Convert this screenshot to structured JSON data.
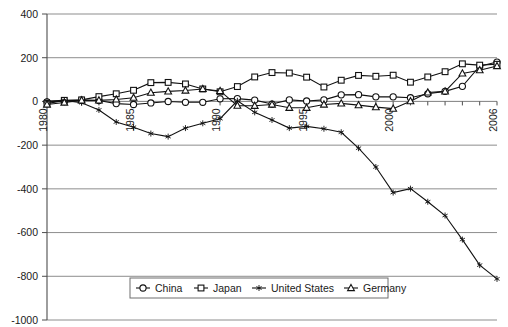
{
  "chart_data": {
    "type": "line",
    "title": "",
    "xlabel": "",
    "ylabel": "",
    "ylim": [
      -1000,
      400
    ],
    "xlim": [
      1980,
      2006
    ],
    "grid": true,
    "legend_position": "bottom",
    "ytick_labels": [
      "400",
      "200",
      "0",
      "-200",
      "-400",
      "-600",
      "-800",
      "-1000"
    ],
    "ytick_values": [
      400,
      200,
      0,
      -200,
      -400,
      -600,
      -800,
      -1000
    ],
    "xtick_labels": [
      "1980",
      "1985",
      "1990",
      "1995",
      "2000",
      "2006"
    ],
    "xtick_values": [
      1980,
      1985,
      1990,
      1995,
      2000,
      2006
    ],
    "x": [
      1980,
      1981,
      1982,
      1983,
      1984,
      1985,
      1986,
      1987,
      1988,
      1989,
      1990,
      1991,
      1992,
      1993,
      1994,
      1995,
      1996,
      1997,
      1998,
      1999,
      2000,
      2001,
      2002,
      2003,
      2004,
      2005,
      2006
    ],
    "series": [
      {
        "name": "China",
        "marker": "circle-open",
        "values": [
          -2,
          2,
          6,
          4,
          -10,
          -14,
          -7,
          0,
          -4,
          -4,
          12,
          13,
          6,
          -12,
          7,
          2,
          7,
          30,
          31,
          21,
          21,
          17,
          35,
          46,
          69,
          161,
          180
        ]
      },
      {
        "name": "Japan",
        "marker": "square-open",
        "values": [
          -10,
          5,
          7,
          22,
          35,
          51,
          86,
          87,
          80,
          57,
          44,
          68,
          112,
          132,
          130,
          111,
          66,
          97,
          119,
          115,
          120,
          88,
          112,
          136,
          172,
          166,
          170
        ]
      },
      {
        "name": "United States",
        "marker": "star-filled",
        "values": [
          2,
          5,
          -6,
          -39,
          -94,
          -118,
          -147,
          -161,
          -122,
          -100,
          -79,
          3,
          -50,
          -85,
          -122,
          -114,
          -125,
          -141,
          -214,
          -300,
          -417,
          -399,
          -459,
          -522,
          -632,
          -749,
          -812
        ]
      },
      {
        "name": "Germany",
        "marker": "triangle-open",
        "values": [
          -14,
          -5,
          5,
          5,
          9,
          17,
          40,
          46,
          50,
          57,
          48,
          -19,
          -20,
          -14,
          -29,
          -29,
          -14,
          -9,
          -17,
          -26,
          -33,
          1,
          41,
          46,
          128,
          143,
          162
        ]
      }
    ]
  },
  "legend": {
    "items": [
      {
        "label": "China",
        "marker": "circle-open"
      },
      {
        "label": "Japan",
        "marker": "square-open"
      },
      {
        "label": "United States",
        "marker": "star-filled"
      },
      {
        "label": "Germany",
        "marker": "triangle-open"
      }
    ]
  }
}
